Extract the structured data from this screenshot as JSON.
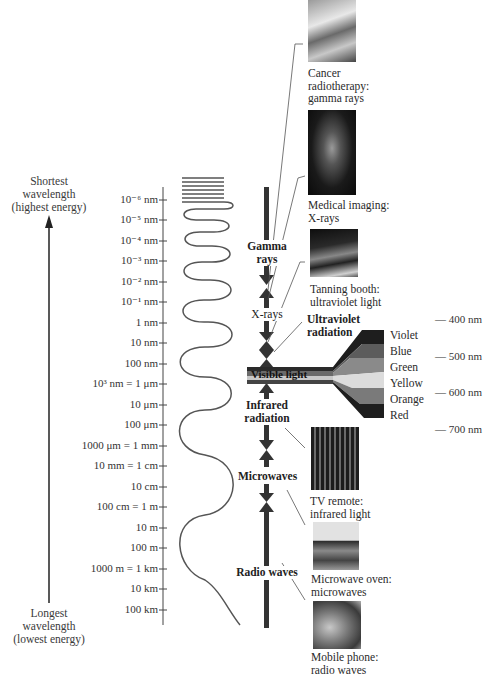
{
  "energy_axis": {
    "top_label": [
      "Shortest",
      "wavelength",
      "(highest energy)"
    ],
    "bottom_label": [
      "Longest",
      "wavelength",
      "(lowest energy)"
    ]
  },
  "wavelength_scale": [
    {
      "label": "10⁻⁶ nm",
      "y": 200
    },
    {
      "label": "10⁻⁵ nm",
      "y": 220
    },
    {
      "label": "10⁻⁴ nm",
      "y": 241
    },
    {
      "label": "10⁻³ nm",
      "y": 261
    },
    {
      "label": "10⁻² nm",
      "y": 282
    },
    {
      "label": "10⁻¹ nm",
      "y": 302
    },
    {
      "label": "1 nm",
      "y": 323
    },
    {
      "label": "10 nm",
      "y": 343
    },
    {
      "label": "100 nm",
      "y": 364
    },
    {
      "label": "10³ nm = 1 μm",
      "y": 384
    },
    {
      "label": "10 μm",
      "y": 405
    },
    {
      "label": "100 μm",
      "y": 425
    },
    {
      "label": "1000 μm = 1 mm",
      "y": 446
    },
    {
      "label": "10 mm = 1 cm",
      "y": 466
    },
    {
      "label": "10 cm",
      "y": 487
    },
    {
      "label": "100 cm = 1 m",
      "y": 507
    },
    {
      "label": "10 m",
      "y": 528
    },
    {
      "label": "100 m",
      "y": 548
    },
    {
      "label": "1000 m = 1 km",
      "y": 569
    },
    {
      "label": "10 km",
      "y": 589
    },
    {
      "label": "100 km",
      "y": 610
    }
  ],
  "bands": {
    "gamma": [
      "Gamma",
      "rays"
    ],
    "xrays": "X-rays",
    "ultraviolet": [
      "Ultraviolet",
      "radiation"
    ],
    "visible": "Visible light",
    "infrared": [
      "Infrared",
      "radiation"
    ],
    "microwaves": "Microwaves",
    "radio": "Radio waves"
  },
  "visible_spectrum": {
    "colors": [
      "Violet",
      "Blue",
      "Green",
      "Yellow",
      "Orange",
      "Red"
    ],
    "wavelength_marks": [
      "— 400 nm",
      "— 500 nm",
      "— 600 nm",
      "— 700 nm"
    ]
  },
  "examples": [
    {
      "caption": [
        "Cancer",
        "radiotherapy:",
        "gamma rays"
      ],
      "icon": "radiotherapy-photo"
    },
    {
      "caption": [
        "Medical imaging:",
        "X-rays"
      ],
      "icon": "xray-hand-photo"
    },
    {
      "caption": [
        "Tanning booth:",
        "ultraviolet light"
      ],
      "icon": "tanning-booth-photo"
    },
    {
      "caption": [
        "TV remote:",
        "infrared light"
      ],
      "icon": "tv-remote-photo"
    },
    {
      "caption": [
        "Microwave oven:",
        "microwaves"
      ],
      "icon": "microwave-oven-photo"
    },
    {
      "caption": [
        "Mobile phone:",
        "radio waves"
      ],
      "icon": "mobile-phone-photo"
    }
  ],
  "colors": {
    "line": "#3a3a3a",
    "arrow": "#333333",
    "text": "#2a2a2a"
  }
}
